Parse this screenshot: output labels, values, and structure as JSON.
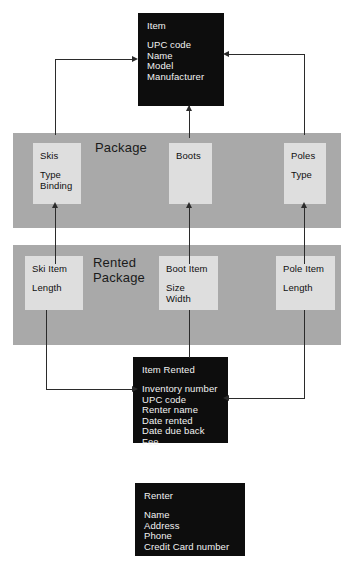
{
  "diagram": {
    "colors": {
      "entity_fill": "#0d0d0d",
      "entity_text": "#f2f2f2",
      "band_fill": "#a9a9a9",
      "member_fill": "#dedede",
      "member_text": "#101010",
      "connector": "#2b2b2b",
      "page_background": "#ffffff"
    },
    "entities": [
      {
        "id": "item",
        "title": "Item",
        "attributes": [
          "UPC code",
          "Name",
          "Model",
          "Manufacturer"
        ]
      },
      {
        "id": "item_rented",
        "title": "Item Rented",
        "attributes": [
          "Inventory number",
          "UPC code",
          "Renter name",
          "Date rented",
          "Date due back",
          "Fee"
        ]
      },
      {
        "id": "renter",
        "title": "Renter",
        "attributes": [
          "Name",
          "Address",
          "Phone",
          "Credit Card number"
        ]
      }
    ],
    "bands": [
      {
        "id": "package",
        "label": "Package",
        "members": [
          {
            "id": "skis",
            "title": "Skis",
            "attributes": [
              "Type",
              "Binding"
            ]
          },
          {
            "id": "boots",
            "title": "Boots",
            "attributes": []
          },
          {
            "id": "poles",
            "title": "Poles",
            "attributes": [
              "Type"
            ]
          }
        ]
      },
      {
        "id": "rented_package",
        "label_line1": "Rented",
        "label_line2": "Package",
        "label": "Rented Package",
        "members": [
          {
            "id": "ski_item",
            "title": "Ski Item",
            "attributes": [
              "Length"
            ]
          },
          {
            "id": "boot_item",
            "title": "Boot Item",
            "attributes": [
              "Size",
              "Width"
            ]
          },
          {
            "id": "pole_item",
            "title": "Pole Item",
            "attributes": [
              "Length"
            ]
          }
        ]
      }
    ],
    "connectors": [
      {
        "id": "skis-to-item",
        "from": "skis",
        "to": "item",
        "style": "elbow",
        "arrow": "right"
      },
      {
        "id": "boots-to-item",
        "from": "boots",
        "to": "item",
        "style": "straight",
        "arrow": "up"
      },
      {
        "id": "poles-to-item",
        "from": "poles",
        "to": "item",
        "style": "elbow",
        "arrow": "left"
      },
      {
        "id": "skiitem-to-skis",
        "from": "ski_item",
        "to": "skis",
        "style": "straight",
        "arrow": "up"
      },
      {
        "id": "bootitem-to-boots",
        "from": "boot_item",
        "to": "boots",
        "style": "straight",
        "arrow": "up"
      },
      {
        "id": "poleitem-to-poles",
        "from": "pole_item",
        "to": "poles",
        "style": "straight",
        "arrow": "up"
      },
      {
        "id": "skiitem-to-rented",
        "from": "ski_item",
        "to": "item_rented",
        "style": "elbow",
        "arrow": "right"
      },
      {
        "id": "bootitem-to-rented",
        "from": "boot_item",
        "to": "item_rented",
        "style": "straight",
        "arrow": "none"
      },
      {
        "id": "poleitem-to-rented",
        "from": "pole_item",
        "to": "item_rented",
        "style": "elbow",
        "arrow": "left"
      }
    ]
  }
}
